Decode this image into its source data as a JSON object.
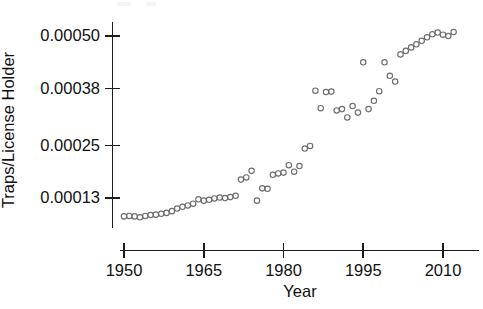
{
  "chart_data": {
    "type": "scatter",
    "title": "",
    "xlabel": "Year",
    "ylabel": "Traps/License Holder",
    "xlim": [
      1949,
      2013
    ],
    "ylim": [
      4e-05,
      0.00056
    ],
    "grid": false,
    "legend": null,
    "xticks": [
      1950,
      1965,
      1980,
      1995,
      2010
    ],
    "xtick_labels": [
      "1950",
      "1965",
      "1980",
      "1995",
      "2010"
    ],
    "yticks": [
      0.00013,
      0.00025,
      0.00038,
      0.0005
    ],
    "ytick_labels": [
      "0.00013",
      "0.00025",
      "0.00038",
      "0.00050"
    ],
    "marker": "open-circle",
    "marker_color": "#6e6e72",
    "x": [
      1950,
      1951,
      1952,
      1953,
      1954,
      1955,
      1956,
      1957,
      1958,
      1959,
      1960,
      1961,
      1962,
      1963,
      1964,
      1965,
      1966,
      1967,
      1968,
      1969,
      1970,
      1971,
      1972,
      1973,
      1974,
      1975,
      1976,
      1977,
      1978,
      1979,
      1980,
      1981,
      1982,
      1983,
      1984,
      1985,
      1986,
      1987,
      1988,
      1989,
      1990,
      1991,
      1992,
      1993,
      1994,
      1995,
      1996,
      1997,
      1998,
      1999,
      2000,
      2001,
      2002,
      2003,
      2004,
      2005,
      2006,
      2007,
      2008,
      2009,
      2010,
      2011,
      2012
    ],
    "y": [
      8.8e-05,
      8.9e-05,
      8.8e-05,
      8.6e-05,
      8.9e-05,
      9.1e-05,
      9.2e-05,
      9.4e-05,
      9.6e-05,
      0.0001,
      0.000106,
      0.00011,
      0.000113,
      0.000117,
      0.000127,
      0.000124,
      0.000126,
      0.000129,
      0.000131,
      0.00013,
      0.000132,
      0.000135,
      0.000172,
      0.000177,
      0.000192,
      0.000124,
      0.000152,
      0.000151,
      0.000183,
      0.000186,
      0.000188,
      0.000205,
      0.00019,
      0.000203,
      0.000243,
      0.000249,
      0.000375,
      0.000335,
      0.000372,
      0.000373,
      0.00033,
      0.000333,
      0.000314,
      0.00034,
      0.000325,
      0.00044,
      0.000333,
      0.000352,
      0.000374,
      0.00044,
      0.000409,
      0.000396,
      0.000458,
      0.000466,
      0.000474,
      0.000481,
      0.000489,
      0.000497,
      0.000504,
      0.000508,
      0.000503,
      0.0005,
      0.000509
    ]
  },
  "axes": {
    "y_axis_title": "Traps/License Holder",
    "x_axis_title": "Year"
  }
}
